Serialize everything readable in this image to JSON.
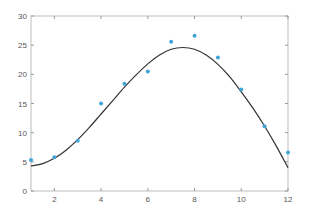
{
  "chart_data": {
    "type": "scatter",
    "title": "",
    "xlabel": "",
    "ylabel": "",
    "xlim": [
      1,
      12
    ],
    "ylim": [
      0,
      30
    ],
    "grid": false,
    "legend": null,
    "x_ticks": [
      2,
      4,
      6,
      8,
      10,
      12
    ],
    "y_ticks": [
      0,
      5,
      10,
      15,
      20,
      25,
      30
    ],
    "x_tick_labels": [
      "2",
      "4",
      "6",
      "8",
      "10",
      "12"
    ],
    "y_tick_labels": [
      "0",
      "5",
      "10",
      "15",
      "20",
      "25",
      "30"
    ],
    "series": [
      {
        "name": "data",
        "kind": "scatter",
        "color": "#3fa4d6",
        "x": [
          1,
          2,
          3,
          4,
          5,
          6,
          7,
          8,
          9,
          10,
          11,
          12
        ],
        "y": [
          5.3,
          5.8,
          8.6,
          15.0,
          18.4,
          20.5,
          25.6,
          26.6,
          22.9,
          17.4,
          11.1,
          6.6
        ]
      },
      {
        "name": "fit",
        "kind": "line",
        "color": "#333333",
        "x": [
          1,
          1.5,
          2,
          2.5,
          3,
          3.5,
          4,
          4.5,
          5,
          5.5,
          6,
          6.5,
          7,
          7.5,
          8,
          8.5,
          9,
          9.5,
          10,
          10.5,
          11,
          11.5,
          12
        ],
        "y": [
          4.3,
          4.7,
          5.6,
          7.0,
          8.8,
          10.9,
          13.2,
          15.5,
          17.8,
          19.9,
          21.8,
          23.3,
          24.3,
          24.6,
          24.3,
          23.3,
          21.7,
          19.6,
          17.0,
          14.2,
          11.1,
          7.7,
          4.0
        ]
      }
    ]
  }
}
